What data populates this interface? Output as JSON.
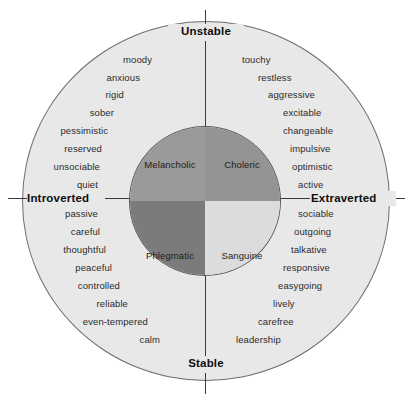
{
  "diagram": {
    "type": "circumplex",
    "background_color": "#ffffff",
    "outer_ring_color": "#e8e8e8",
    "outer_ring_border_color": "#6d6d6d",
    "axis_color": "#3a3a3a"
  },
  "axes": {
    "vertical": {
      "top_pole": "Unstable",
      "bottom_pole": "Stable",
      "name": "neuroticism"
    },
    "horizontal": {
      "left_pole": "Introverted",
      "right_pole": "Extraverted",
      "name": "extraversion"
    }
  },
  "quadrants": [
    {
      "key": "melancholic",
      "label": "Melancholic",
      "position": "upper-left",
      "color": "#9a9a9a",
      "poles": [
        "Unstable",
        "Introverted"
      ],
      "traits": [
        {
          "text": "moody",
          "x": 152,
          "y": 54,
          "align": "right"
        },
        {
          "text": "anxious",
          "x": 140,
          "y": 72,
          "align": "right"
        },
        {
          "text": "rigid",
          "x": 124,
          "y": 89,
          "align": "right"
        },
        {
          "text": "sober",
          "x": 114,
          "y": 107,
          "align": "right"
        },
        {
          "text": "pessimistic",
          "x": 108,
          "y": 125,
          "align": "right"
        },
        {
          "text": "reserved",
          "x": 102,
          "y": 143,
          "align": "right"
        },
        {
          "text": "unsociable",
          "x": 100,
          "y": 161,
          "align": "right"
        },
        {
          "text": "quiet",
          "x": 98,
          "y": 179,
          "align": "right"
        }
      ]
    },
    {
      "key": "choleric",
      "label": "Choleric",
      "position": "upper-right",
      "color": "#949494",
      "poles": [
        "Unstable",
        "Extraverted"
      ],
      "traits": [
        {
          "text": "touchy",
          "x": 242,
          "y": 54,
          "align": "left"
        },
        {
          "text": "restless",
          "x": 258,
          "y": 72,
          "align": "left"
        },
        {
          "text": "aggressive",
          "x": 268,
          "y": 89,
          "align": "left"
        },
        {
          "text": "excitable",
          "x": 283,
          "y": 107,
          "align": "left"
        },
        {
          "text": "changeable",
          "x": 283,
          "y": 125,
          "align": "left"
        },
        {
          "text": "impulsive",
          "x": 290,
          "y": 143,
          "align": "left"
        },
        {
          "text": "optimistic",
          "x": 292,
          "y": 161,
          "align": "left"
        },
        {
          "text": "active",
          "x": 298,
          "y": 179,
          "align": "left"
        }
      ]
    },
    {
      "key": "phlegmatic",
      "label": "Phlegmatic",
      "position": "lower-left",
      "color": "#7b7b7b",
      "poles": [
        "Stable",
        "Introverted"
      ],
      "traits": [
        {
          "text": "passive",
          "x": 98,
          "y": 208,
          "align": "right"
        },
        {
          "text": "careful",
          "x": 100,
          "y": 226,
          "align": "right"
        },
        {
          "text": "thoughtful",
          "x": 106,
          "y": 244,
          "align": "right"
        },
        {
          "text": "peaceful",
          "x": 112,
          "y": 262,
          "align": "right"
        },
        {
          "text": "controlled",
          "x": 120,
          "y": 280,
          "align": "right"
        },
        {
          "text": "reliable",
          "x": 128,
          "y": 298,
          "align": "right"
        },
        {
          "text": "even-tempered",
          "x": 148,
          "y": 316,
          "align": "right"
        },
        {
          "text": "calm",
          "x": 160,
          "y": 334,
          "align": "right"
        }
      ]
    },
    {
      "key": "sanguine",
      "label": "Sanguine",
      "position": "lower-right",
      "color": "#dcdcdc",
      "poles": [
        "Stable",
        "Extraverted"
      ],
      "traits": [
        {
          "text": "sociable",
          "x": 298,
          "y": 208,
          "align": "left"
        },
        {
          "text": "outgoing",
          "x": 294,
          "y": 226,
          "align": "left"
        },
        {
          "text": "talkative",
          "x": 291,
          "y": 244,
          "align": "left"
        },
        {
          "text": "responsive",
          "x": 283,
          "y": 262,
          "align": "left"
        },
        {
          "text": "easygoing",
          "x": 278,
          "y": 280,
          "align": "left"
        },
        {
          "text": "lively",
          "x": 273,
          "y": 298,
          "align": "left"
        },
        {
          "text": "carefree",
          "x": 258,
          "y": 316,
          "align": "left"
        },
        {
          "text": "leadership",
          "x": 236,
          "y": 334,
          "align": "left"
        }
      ]
    }
  ]
}
